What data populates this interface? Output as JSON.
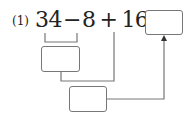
{
  "problem": {
    "label": "(1)",
    "expression": {
      "a": "34",
      "op1": "−",
      "b": "8",
      "op2": "+",
      "c": "16",
      "eq": "="
    },
    "boxes": {
      "answer": "",
      "step1": "",
      "step2": ""
    }
  },
  "colors": {
    "text": "#222222",
    "lines": "#777777",
    "background": "#ffffff"
  }
}
